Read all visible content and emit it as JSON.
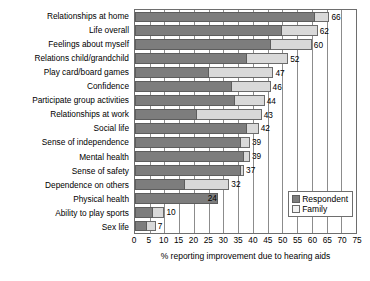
{
  "chart_data": {
    "type": "bar",
    "orientation": "horizontal",
    "title": "",
    "xlabel": "% reporting improvement due to hearing aids",
    "ylabel": "",
    "xlim": [
      0,
      75
    ],
    "xticks": [
      0,
      5,
      10,
      15,
      20,
      25,
      30,
      35,
      40,
      45,
      50,
      55,
      60,
      65,
      70,
      75
    ],
    "grid": true,
    "legend_position": "bottom-right",
    "categories": [
      "Relationships at home",
      "Life overall",
      "Feelings about myself",
      "Relations child/grandchild",
      "Play card/board games",
      "Confidence",
      "Participate group activities",
      "Relationships at work",
      "Social life",
      "Sense of independence",
      "Mental health",
      "Sense of safety",
      "Dependence on others",
      "Physical health",
      "Ability to play sports",
      "Sex life"
    ],
    "series": [
      {
        "name": "Respondent",
        "color": "#7d7d7d",
        "values": [
          61,
          50,
          46,
          38,
          25,
          33,
          34,
          21,
          38,
          36,
          37,
          36,
          17,
          28,
          6,
          4
        ]
      },
      {
        "name": "Family",
        "color": "#d9d9d9",
        "values": [
          66,
          62,
          60,
          52,
          47,
          46,
          44,
          43,
          42,
          39,
          39,
          37,
          32,
          24,
          10,
          7
        ]
      }
    ],
    "value_labels": [
      66,
      62,
      60,
      52,
      47,
      46,
      44,
      43,
      42,
      39,
      39,
      37,
      32,
      24,
      10,
      7
    ]
  },
  "legend": {
    "items": [
      {
        "label": "Respondent"
      },
      {
        "label": "Family"
      }
    ]
  }
}
